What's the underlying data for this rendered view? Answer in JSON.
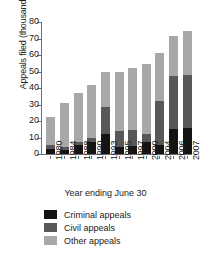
{
  "chart_data": {
    "type": "bar",
    "stacked": true,
    "title": "",
    "xlabel": "Year ending June 30",
    "ylabel": "Appeals filed (thousands)",
    "categories": [
      "1980",
      "1984",
      "1988",
      "1990",
      "1993",
      "1995",
      "1997",
      "2000",
      "2004",
      "2006",
      "2007"
    ],
    "series": [
      {
        "name": "Criminal appeals",
        "color": "#141414",
        "values": [
          3.0,
          2.5,
          5.5,
          7.0,
          12.0,
          4.5,
          5.0,
          7.5,
          5.5,
          15.0,
          16.0
        ]
      },
      {
        "name": "Civil appeals",
        "color": "#585858",
        "values": [
          2.5,
          1.5,
          1.5,
          2.5,
          16.5,
          9.5,
          9.5,
          4.5,
          26.5,
          32.0,
          32.0
        ]
      },
      {
        "name": "Other appeals",
        "color": "#a8a8a8",
        "values": [
          17.0,
          27.0,
          30.0,
          32.5,
          21.0,
          36.0,
          37.5,
          42.5,
          29.0,
          24.5,
          26.5
        ]
      }
    ],
    "totals": [
      22.5,
      31.0,
      37.0,
      42.0,
      49.5,
      50.0,
      52.0,
      54.5,
      61.0,
      71.5,
      74.5
    ],
    "ylim": [
      0,
      80
    ],
    "yticks": [
      0,
      10,
      20,
      30,
      40,
      50,
      60,
      70,
      80
    ],
    "ytick_labels": [
      "0",
      "10",
      "20",
      "30",
      "40",
      "50",
      "60",
      "70",
      "80"
    ],
    "grid": false,
    "legend_position": "bottom-left"
  },
  "legend": {
    "items": [
      {
        "label": "Criminal appeals",
        "color": "#141414"
      },
      {
        "label": "Civil appeals",
        "color": "#585858"
      },
      {
        "label": "Other appeals",
        "color": "#a8a8a8"
      }
    ]
  }
}
